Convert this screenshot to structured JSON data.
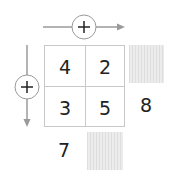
{
  "puzzle": {
    "row_operator": "+",
    "column_operator": "+",
    "cells": [
      {
        "row": 1,
        "col": 1,
        "value": "4"
      },
      {
        "row": 1,
        "col": 2,
        "value": "2"
      },
      {
        "row": 2,
        "col": 1,
        "value": "3"
      },
      {
        "row": 2,
        "col": 2,
        "value": "5"
      }
    ],
    "row_sums": [
      "",
      "8"
    ],
    "column_sums": [
      "7",
      ""
    ],
    "hidden_answer_boxes": [
      "row-1-sum",
      "column-2-sum"
    ]
  },
  "colors": {
    "line": "#9a9a9a",
    "grid": "#c8c8c8",
    "text": "#222222",
    "hatch": "#e6e6e6"
  }
}
